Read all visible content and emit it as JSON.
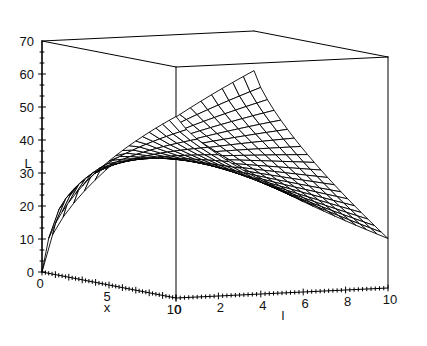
{
  "chart_data": {
    "type": "line",
    "render": "surface3d-wireframe",
    "title": "",
    "subtitle": "",
    "xlabel": "x",
    "ylabel": "l",
    "zlabel": "L",
    "xlim": [
      0,
      10
    ],
    "ylim": [
      0,
      10
    ],
    "zlim": [
      0,
      70
    ],
    "x_ticks": [
      0,
      5,
      10
    ],
    "x_tick_labels": [
      "0",
      "5",
      "10"
    ],
    "y_ticks": [
      0,
      2,
      4,
      6,
      8,
      10
    ],
    "y_tick_labels": [
      "0",
      "2",
      "4",
      "6",
      "8",
      "10"
    ],
    "z_ticks": [
      0,
      10,
      20,
      30,
      40,
      50,
      60,
      70
    ],
    "z_tick_labels": [
      "0",
      "10",
      "20",
      "30",
      "40",
      "50",
      "60",
      "70"
    ],
    "grid": false,
    "legend": false,
    "mesh_nx": 20,
    "mesh_ny": 20,
    "line_color": "#000000",
    "surface_fill": "#ffffff",
    "box_color": "#000000",
    "corner_values": [
      {
        "x": 0,
        "l": 0,
        "L": 0
      },
      {
        "x": 10,
        "l": 0,
        "L": 55
      },
      {
        "x": 0,
        "l": 10,
        "L": 58
      },
      {
        "x": 10,
        "l": 10,
        "L": 15
      }
    ],
    "samples": [
      {
        "x": 0,
        "l": 0,
        "L": 0
      },
      {
        "x": 2,
        "l": 0,
        "L": 26
      },
      {
        "x": 5,
        "l": 0,
        "L": 45
      },
      {
        "x": 8,
        "l": 0,
        "L": 54
      },
      {
        "x": 10,
        "l": 0,
        "L": 55
      },
      {
        "x": 0,
        "l": 5,
        "L": 40
      },
      {
        "x": 5,
        "l": 5,
        "L": 50
      },
      {
        "x": 10,
        "l": 5,
        "L": 36
      },
      {
        "x": 0,
        "l": 10,
        "L": 58
      },
      {
        "x": 5,
        "l": 10,
        "L": 44
      },
      {
        "x": 10,
        "l": 10,
        "L": 15
      }
    ]
  },
  "geometry": {
    "origin_px": [
      42,
      272
    ],
    "x10_px": [
      176,
      298
    ],
    "l10_px": [
      388,
      288
    ],
    "top_left_px": [
      42,
      41
    ],
    "note": "axonometric projection"
  }
}
